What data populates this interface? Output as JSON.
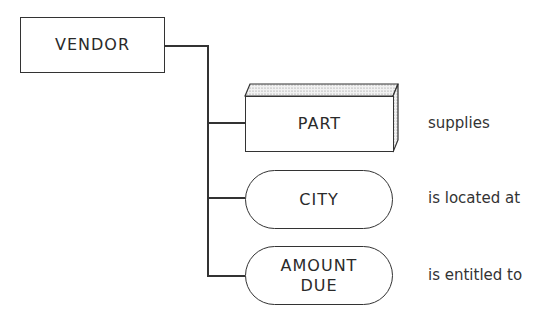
{
  "diagram": {
    "root": {
      "label": "VENDOR",
      "shape": "rectangle"
    },
    "children": [
      {
        "label": "PART",
        "shape": "3d-box",
        "relationship": "supplies"
      },
      {
        "label": "CITY",
        "shape": "rounded-pill",
        "relationship": "is located at"
      },
      {
        "label": "AMOUNT DUE",
        "label_lines": [
          "AMOUNT",
          "DUE"
        ],
        "shape": "rounded-pill",
        "relationship": "is entitled to"
      }
    ],
    "colors": {
      "stroke": "#333333",
      "background": "#ffffff"
    }
  }
}
